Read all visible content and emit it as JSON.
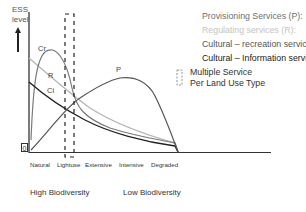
{
  "axis": {
    "y_title_line1": "ESS",
    "y_title_line2": "level",
    "zero_label": "0",
    "x_ticks": [
      "Natural",
      "Lightuse",
      "Extensive",
      "Intensive",
      "Degraded"
    ]
  },
  "biodiversity": {
    "high": "High Biodiversity",
    "low": "Low Biodiversity"
  },
  "curves": {
    "P": "P",
    "R": "R",
    "Cr": "Cr",
    "Ci": "Ci"
  },
  "legend": {
    "provisioning": "Provisioning Services (P):",
    "regulating": "Regulating services (R):",
    "cultural_recreation": "Cultural – recreation services (Cr):",
    "cultural_information": "Cultural – Information services (Ci):",
    "multiple_line1": "Multiple Service",
    "multiple_line2": "Per Land Use Type"
  },
  "colors": {
    "provisioning": "#555555",
    "regulating": "#b5b5b5",
    "cultural_recreation": "#7a7a7a",
    "cultural_information": "#222222"
  }
}
